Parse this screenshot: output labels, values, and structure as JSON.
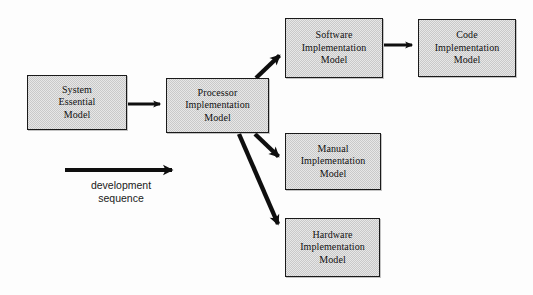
{
  "diagram": {
    "background_color": "#fdfdfd",
    "box_fill_color": "#c9c9c9",
    "box_border_color": "#1a1a1a",
    "arrow_color": "#0f0f0f",
    "nodes": [
      {
        "id": "system-essential-model",
        "label": "System\nEssential\nModel",
        "x": 27,
        "y": 75,
        "width": 100,
        "height": 55
      },
      {
        "id": "processor-implementation-model",
        "label": "Processor\nImplementation\nModel",
        "x": 166,
        "y": 78,
        "width": 103,
        "height": 55
      },
      {
        "id": "software-implementation-model",
        "label": "Software\nImplementation\nModel",
        "x": 285,
        "y": 18,
        "width": 98,
        "height": 60
      },
      {
        "id": "code-implementation-model",
        "label": "Code\nImplementation\nModel",
        "x": 418,
        "y": 19,
        "width": 98,
        "height": 58
      },
      {
        "id": "manual-implementation-model",
        "label": "Manual\nImplementation\nModel",
        "x": 285,
        "y": 133,
        "width": 96,
        "height": 57
      },
      {
        "id": "hardware-implementation-model",
        "label": "Hardware\nImplementation\nModel",
        "x": 285,
        "y": 218,
        "width": 95,
        "height": 59
      }
    ],
    "edges": [
      {
        "id": "edge-system-to-processor",
        "from": "system-essential-model",
        "to": "processor-implementation-model",
        "x1": 128,
        "y1": 104,
        "x2": 163,
        "y2": 104,
        "stroke_width": 3
      },
      {
        "id": "edge-processor-to-software",
        "from": "processor-implementation-model",
        "to": "software-implementation-model",
        "x1": 256,
        "y1": 78,
        "x2": 282,
        "y2": 53,
        "stroke_width": 4
      },
      {
        "id": "edge-software-to-code",
        "from": "software-implementation-model",
        "to": "code-implementation-model",
        "x1": 384,
        "y1": 45,
        "x2": 415,
        "y2": 45,
        "stroke_width": 3
      },
      {
        "id": "edge-processor-to-manual",
        "from": "processor-implementation-model",
        "to": "manual-implementation-model",
        "x1": 255,
        "y1": 134,
        "x2": 282,
        "y2": 160,
        "stroke_width": 4
      },
      {
        "id": "edge-processor-to-hardware",
        "from": "processor-implementation-model",
        "to": "hardware-implementation-model",
        "x1": 239,
        "y1": 134,
        "x2": 282,
        "y2": 233,
        "stroke_width": 4
      }
    ],
    "legend": {
      "arrow": {
        "id": "development-sequence-arrow",
        "x1": 65,
        "y1": 170,
        "x2": 176,
        "y2": 170,
        "stroke_width": 4
      },
      "label": "development\nsequence",
      "label_x": 66,
      "label_y": 179,
      "label_width": 110
    }
  }
}
